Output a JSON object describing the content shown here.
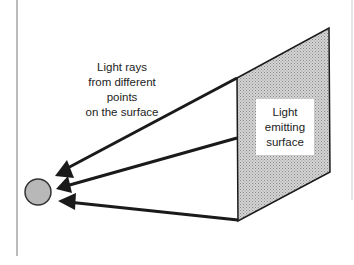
{
  "diagram": {
    "caption_lines": [
      "Light rays",
      "from different",
      "points",
      "on the surface"
    ],
    "surface_label_lines": [
      "Light",
      "emitting",
      "surface"
    ],
    "colors": {
      "stroke": "#1a1a1a",
      "surface_fill": "#c8c8c8",
      "eye_fill": "#b8b8b8",
      "border": "#888888"
    }
  }
}
